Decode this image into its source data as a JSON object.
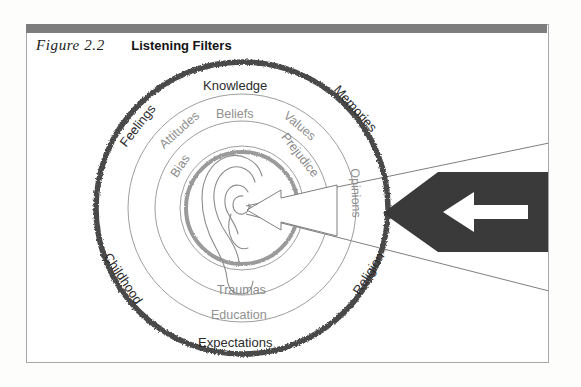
{
  "figure": {
    "number_label": "Figure  2.2",
    "title": "Listening Filters"
  },
  "colors": {
    "header_bar": "#7d7d7d",
    "frame_border": "#a8a8a8",
    "outer_ring": "#4a4a4a",
    "inner_ring_gray": "#9a9a9a",
    "thin_ring": "#9e9e9e",
    "arrow_dark": "#3a3a3a",
    "label_dark": "#2c2c2c",
    "label_gray": "#8f8f8f"
  },
  "diagram": {
    "center_icon": "ear-icon",
    "rings": [
      {
        "name": "outer",
        "labels": [
          {
            "text": "Knowledge",
            "angle": 0,
            "style": "dark"
          },
          {
            "text": "Memories",
            "angle": 48,
            "style": "dark"
          },
          {
            "text": "Religion",
            "angle": 125,
            "style": "dark"
          },
          {
            "text": "Expectations",
            "angle": 180,
            "style": "dark"
          },
          {
            "text": "Childhood",
            "angle": 232,
            "style": "dark"
          },
          {
            "text": "Feelings",
            "angle": 310,
            "style": "dark"
          }
        ]
      },
      {
        "name": "second",
        "labels": [
          {
            "text": "Beliefs",
            "angle": 0,
            "style": "gray"
          },
          {
            "text": "Values",
            "angle": 42,
            "style": "gray"
          },
          {
            "text": "Opinions",
            "angle": 92,
            "style": "gray"
          },
          {
            "text": "Education",
            "angle": 180,
            "style": "gray"
          },
          {
            "text": "Attitudes",
            "angle": 318,
            "style": "gray"
          }
        ]
      },
      {
        "name": "third",
        "labels": [
          {
            "text": "Prejudice",
            "angle": 52,
            "style": "gray"
          },
          {
            "text": "Traumas",
            "angle": 180,
            "style": "gray"
          },
          {
            "text": "Bias",
            "angle": 305,
            "style": "gray"
          }
        ]
      }
    ],
    "arrows": {
      "incoming_sound": "large-left-arrow",
      "ear_entry": "white-outline-left-arrow",
      "funnel": "sound-funnel-lines"
    }
  }
}
